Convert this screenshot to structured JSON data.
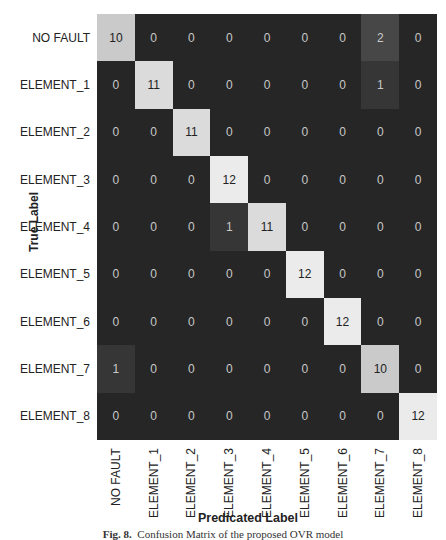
{
  "chart_data": {
    "type": "heatmap",
    "title": "",
    "xlabel": "Predicated Label",
    "ylabel": "True Label",
    "row_labels": [
      "NO FAULT",
      "ELEMENT_1",
      "ELEMENT_2",
      "ELEMENT_3",
      "ELEMENT_4",
      "ELEMENT_5",
      "ELEMENT_6",
      "ELEMENT_7",
      "ELEMENT_8"
    ],
    "col_labels": [
      "NO FAULT",
      "ELEMENT_1",
      "ELEMENT_2",
      "ELEMENT_3",
      "ELEMENT_4",
      "ELEMENT_5",
      "ELEMENT_6",
      "ELEMENT_7",
      "ELEMENT_8"
    ],
    "matrix": [
      [
        10,
        0,
        0,
        0,
        0,
        0,
        0,
        2,
        0
      ],
      [
        0,
        11,
        0,
        0,
        0,
        0,
        0,
        1,
        0
      ],
      [
        0,
        0,
        11,
        0,
        0,
        0,
        0,
        0,
        0
      ],
      [
        0,
        0,
        0,
        12,
        0,
        0,
        0,
        0,
        0
      ],
      [
        0,
        0,
        0,
        1,
        11,
        0,
        0,
        0,
        0
      ],
      [
        0,
        0,
        0,
        0,
        0,
        12,
        0,
        0,
        0
      ],
      [
        0,
        0,
        0,
        0,
        0,
        0,
        12,
        0,
        0
      ],
      [
        1,
        0,
        0,
        0,
        0,
        0,
        0,
        10,
        0
      ],
      [
        0,
        0,
        0,
        0,
        0,
        0,
        0,
        0,
        12
      ]
    ],
    "colormap": "grayscale (dark=low, light=high)",
    "vmax": 12
  },
  "caption": {
    "fig": "Fig. 8.",
    "text": "Confusion Matrix of the proposed OVR model"
  }
}
